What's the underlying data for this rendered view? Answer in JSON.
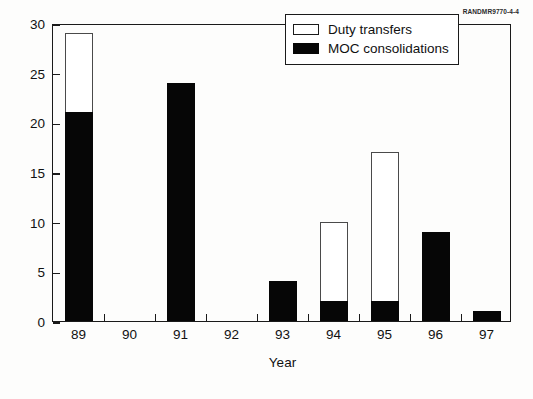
{
  "figure": {
    "source_id": "RANDMR9770-4-4"
  },
  "chart_data": {
    "type": "bar",
    "title": "",
    "subtitle": "",
    "xlabel": "Year",
    "ylabel": "Number of MOC changes",
    "categories": [
      "89",
      "90",
      "91",
      "92",
      "93",
      "94",
      "95",
      "96",
      "97"
    ],
    "series": [
      {
        "name": "MOC consolidations",
        "color": "#060606",
        "values": [
          21,
          0,
          24,
          0,
          4,
          2,
          2,
          9,
          1
        ]
      },
      {
        "name": "Duty transfers",
        "color": "#ffffff",
        "values": [
          8,
          0,
          0,
          0,
          0,
          8,
          15,
          0,
          0
        ]
      }
    ],
    "stacked": true,
    "totals": [
      29,
      0,
      24,
      0,
      4,
      10,
      17,
      9,
      1
    ],
    "ylim": [
      0,
      30
    ],
    "yticks": [
      0,
      5,
      10,
      15,
      20,
      25,
      30
    ],
    "ytick_labels": [
      "0",
      "5",
      "10",
      "15",
      "20",
      "25",
      "30"
    ],
    "grid": false,
    "legend_position": "top-right",
    "legend": [
      {
        "label": "Duty transfers",
        "swatch": "light"
      },
      {
        "label": "MOC consolidations",
        "swatch": "dark"
      }
    ]
  }
}
